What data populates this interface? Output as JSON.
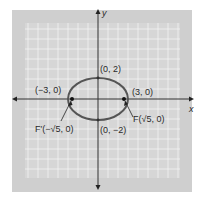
{
  "figure": {
    "type": "ellipse-graph",
    "equation_implied": "x^2/9 + y^2/4 = 1",
    "axes": {
      "x_label": "x",
      "y_label": "y"
    },
    "colors": {
      "panel": "#cfcfcf",
      "grid_background": "#d9d9d9",
      "grid_lines": "#f4f4f4",
      "axes": "#333333",
      "ellipse": "#555555",
      "points": "#111111"
    },
    "labels": {
      "top_vertex": "(0, 2)",
      "bottom_vertex": "(0, −2)",
      "left_vertex": "(−3, 0)",
      "right_vertex": "(3, 0)",
      "left_focus": "F′(−√5, 0)",
      "right_focus": "F(√5, 0)"
    },
    "points": [
      {
        "name": "top_vertex",
        "x": 0,
        "y": 2
      },
      {
        "name": "bottom_vertex",
        "x": 0,
        "y": -2
      },
      {
        "name": "left_vertex",
        "x": -3,
        "y": 0
      },
      {
        "name": "right_vertex",
        "x": 3,
        "y": 0
      },
      {
        "name": "left_focus",
        "x": -2.236,
        "y": 0
      },
      {
        "name": "right_focus",
        "x": 2.236,
        "y": 0
      }
    ]
  }
}
